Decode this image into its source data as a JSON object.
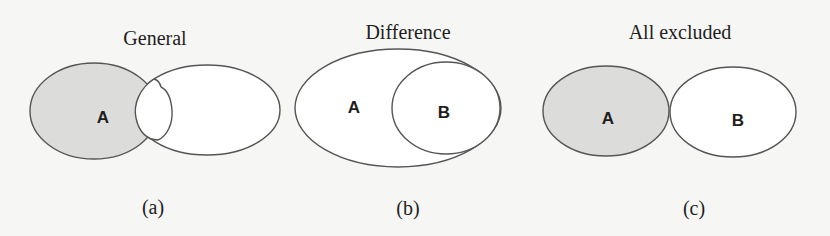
{
  "panels": [
    {
      "id": "a",
      "title": "General",
      "caption": "(a)",
      "sets": [
        {
          "label": "A",
          "shaded": true
        },
        {
          "label": "",
          "shaded": false
        }
      ],
      "relation": "partial-overlap"
    },
    {
      "id": "b",
      "title": "Difference",
      "caption": "(b)",
      "sets": [
        {
          "label": "A",
          "shaded": false
        },
        {
          "label": "B",
          "shaded": false
        }
      ],
      "relation": "B-contained-in-A"
    },
    {
      "id": "c",
      "title": "All excluded",
      "caption": "(c)",
      "sets": [
        {
          "label": "A",
          "shaded": true
        },
        {
          "label": "B",
          "shaded": false
        }
      ],
      "relation": "disjoint-touching"
    }
  ],
  "colors": {
    "shaded_fill": "#dcdcda",
    "unshaded_fill": "#ffffff",
    "outline": "#555555",
    "background": "#f6f6f4",
    "text": "#1e1e1e"
  }
}
